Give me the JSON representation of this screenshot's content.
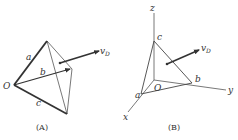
{
  "panels": [
    {
      "caption": "(A)",
      "labels": {
        "origin": "O",
        "a": "a",
        "b": "b",
        "c": "c",
        "velocity": "v",
        "velocity_sub": "D"
      }
    },
    {
      "caption": "(B)",
      "labels": {
        "origin": "O",
        "a": "a",
        "b": "b",
        "c": "c",
        "x": "x",
        "y": "y",
        "z": "z",
        "velocity": "v",
        "velocity_sub": "D"
      }
    }
  ],
  "colors": {
    "stroke": "#333333",
    "thin": "#555555",
    "background": "#ffffff"
  }
}
